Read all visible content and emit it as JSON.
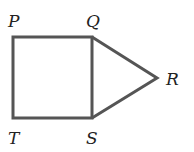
{
  "diagram": {
    "stroke_color": "#555555",
    "label_color": "#222222",
    "vertices": {
      "P": {
        "label": "P",
        "x": 12,
        "y": 37
      },
      "Q": {
        "label": "Q",
        "x": 92,
        "y": 37
      },
      "R": {
        "label": "R",
        "x": 157,
        "y": 78
      },
      "S": {
        "label": "S",
        "x": 92,
        "y": 118
      },
      "T": {
        "label": "T",
        "x": 12,
        "y": 118
      }
    },
    "shapes": [
      {
        "type": "square",
        "vertices": [
          "P",
          "Q",
          "S",
          "T"
        ]
      },
      {
        "type": "triangle",
        "vertices": [
          "Q",
          "R",
          "S"
        ]
      }
    ],
    "labels": {
      "P": "P",
      "Q": "Q",
      "R": "R",
      "S": "S",
      "T": "T"
    }
  }
}
